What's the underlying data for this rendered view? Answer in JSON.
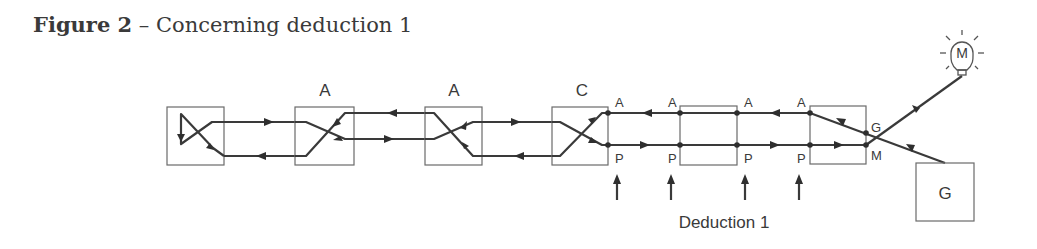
{
  "title": {
    "figure": "Figure 2",
    "dash": " – ",
    "caption": "Concerning deduction 1"
  },
  "diagram": {
    "box_labels": {
      "box2": "A",
      "box3": "A",
      "box4": "C",
      "box_g": "G"
    },
    "port_labels": {
      "a1": "A",
      "p1": "P",
      "a2": "A",
      "p2": "P",
      "a3": "A",
      "p3": "P",
      "a4": "A",
      "p4": "P",
      "g": "G",
      "m": "M"
    },
    "bulb_label": "M",
    "deduction_label": "Deduction 1",
    "colors": {
      "line": "#3a3a3a",
      "box": "#6a6a6a",
      "text": "#3a3a3a"
    }
  }
}
